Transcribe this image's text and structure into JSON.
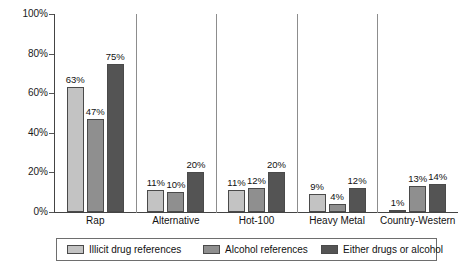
{
  "chart_data": {
    "type": "bar",
    "title": "",
    "subtitle": "",
    "xlabel": "",
    "ylabel": "",
    "ylim": [
      0,
      100
    ],
    "ytick_labels": [
      "0%",
      "20%",
      "40%",
      "60%",
      "80%",
      "100%"
    ],
    "ytick_values": [
      0,
      20,
      40,
      60,
      80,
      100
    ],
    "grid": false,
    "legend_position": "bottom",
    "value_label_suffix": "%",
    "categories": [
      "Rap",
      "Alternative",
      "Hot-100",
      "Heavy Metal",
      "Country-Western"
    ],
    "series": [
      {
        "name": "Illicit drug references",
        "color": "#c3c3c3",
        "values": [
          63,
          11,
          11,
          9,
          1
        ],
        "labels": [
          "63%",
          "11%",
          "11%",
          "9%",
          "1%"
        ]
      },
      {
        "name": "Alcohol references",
        "color": "#8f8f8f",
        "values": [
          47,
          10,
          12,
          4,
          13
        ],
        "labels": [
          "47%",
          "10%",
          "12%",
          "4%",
          "13%"
        ]
      },
      {
        "name": "Either drugs or alcohol",
        "color": "#545454",
        "values": [
          75,
          20,
          20,
          12,
          14
        ],
        "labels": [
          "75%",
          "20%",
          "20%",
          "12%",
          "14%"
        ]
      }
    ]
  },
  "colors": {
    "axis": "#444444",
    "separator": "#8d8d8d",
    "bar_border": "#4a4a4a",
    "background": "#ffffff",
    "text": "#111111"
  }
}
